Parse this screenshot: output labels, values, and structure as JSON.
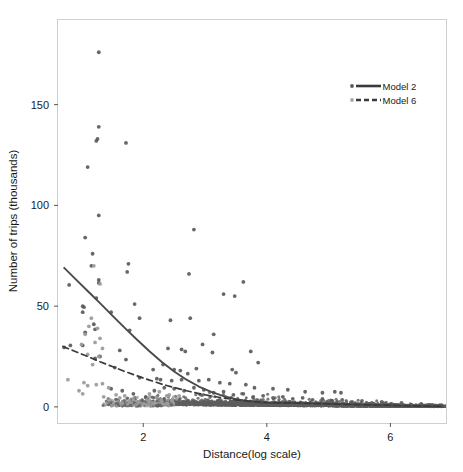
{
  "chart_data": {
    "type": "scatter",
    "title": "",
    "xlabel": "Distance(log scale)",
    "ylabel": "Number of trips (thousands)",
    "xlim": [
      0.62,
      6.9
    ],
    "ylim": [
      -8,
      192
    ],
    "xticks": [
      2,
      4,
      6
    ],
    "xtick_labels": [
      "2",
      "4",
      "6"
    ],
    "yticks": [
      0,
      50,
      100,
      150
    ],
    "ytick_labels": [
      "0",
      "50",
      "100",
      "150"
    ],
    "grid": false,
    "legend_position": "top-right",
    "panel_border": true,
    "series": [
      {
        "name": "Model 2",
        "marker": "circle",
        "color": "#5a5a5a",
        "line_style": "solid",
        "line_color": "#4a4a4a",
        "fit_curve": [
          [
            0.72,
            69.0
          ],
          [
            0.9,
            63.5
          ],
          [
            1.1,
            57.5
          ],
          [
            1.3,
            51.5
          ],
          [
            1.5,
            45.3
          ],
          [
            1.7,
            39.2
          ],
          [
            1.9,
            33.3
          ],
          [
            2.1,
            27.6
          ],
          [
            2.3,
            22.3
          ],
          [
            2.5,
            17.6
          ],
          [
            2.7,
            13.5
          ],
          [
            2.9,
            10.1
          ],
          [
            3.1,
            7.4
          ],
          [
            3.3,
            5.3
          ],
          [
            3.5,
            3.8
          ],
          [
            3.7,
            2.8
          ],
          [
            3.9,
            2.2
          ],
          [
            4.1,
            1.9
          ],
          [
            4.3,
            1.9
          ],
          [
            4.5,
            1.9
          ],
          [
            4.8,
            1.7
          ],
          [
            5.1,
            1.4
          ],
          [
            5.4,
            1.1
          ],
          [
            5.8,
            0.8
          ],
          [
            6.2,
            0.5
          ],
          [
            6.6,
            0.3
          ],
          [
            6.85,
            0.2
          ]
        ],
        "points": [
          [
            1.28,
            176.0
          ],
          [
            1.28,
            139.0
          ],
          [
            1.24,
            132.0
          ],
          [
            1.26,
            133.0
          ],
          [
            1.72,
            131.0
          ],
          [
            1.1,
            119.0
          ],
          [
            1.28,
            95.0
          ],
          [
            1.06,
            84.0
          ],
          [
            1.18,
            76.0
          ],
          [
            2.82,
            88.0
          ],
          [
            1.76,
            71.0
          ],
          [
            1.16,
            70.0
          ],
          [
            1.74,
            67.0
          ],
          [
            2.74,
            66.0
          ],
          [
            1.28,
            63.0
          ],
          [
            1.28,
            61.5
          ],
          [
            0.8,
            60.5
          ],
          [
            3.62,
            62.0
          ],
          [
            3.3,
            56.0
          ],
          [
            3.48,
            55.0
          ],
          [
            1.24,
            54.0
          ],
          [
            1.86,
            51.0
          ],
          [
            1.02,
            50.0
          ],
          [
            1.04,
            49.5
          ],
          [
            1.48,
            47.0
          ],
          [
            1.02,
            47.0
          ],
          [
            1.94,
            44.0
          ],
          [
            2.76,
            44.0
          ],
          [
            2.44,
            43.0
          ],
          [
            1.2,
            41.0
          ],
          [
            1.78,
            38.0
          ],
          [
            1.22,
            38.5
          ],
          [
            1.06,
            37.0
          ],
          [
            3.14,
            36.0
          ],
          [
            2.96,
            31.0
          ],
          [
            2.4,
            29.0
          ],
          [
            1.62,
            28.0
          ],
          [
            0.72,
            29.5
          ],
          [
            0.82,
            30.5
          ],
          [
            1.02,
            30.5
          ],
          [
            2.62,
            28.5
          ],
          [
            2.68,
            27.5
          ],
          [
            3.74,
            27.5
          ],
          [
            3.12,
            27.0
          ],
          [
            3.86,
            22.0
          ],
          [
            1.72,
            23.5
          ],
          [
            1.3,
            25.0
          ],
          [
            1.22,
            24.0
          ],
          [
            2.32,
            21.0
          ],
          [
            2.16,
            18.5
          ],
          [
            2.6,
            18.0
          ],
          [
            2.5,
            18.5
          ],
          [
            2.86,
            19.0
          ],
          [
            3.44,
            18.5
          ],
          [
            3.5,
            17.0
          ],
          [
            2.72,
            16.5
          ],
          [
            1.54,
            19.5
          ],
          [
            1.94,
            14.5
          ],
          [
            2.22,
            14.0
          ],
          [
            2.28,
            13.5
          ],
          [
            2.46,
            13.0
          ],
          [
            2.62,
            13.5
          ],
          [
            2.9,
            13.0
          ],
          [
            3.06,
            13.5
          ],
          [
            3.24,
            12.0
          ],
          [
            3.4,
            11.5
          ],
          [
            3.66,
            11.0
          ],
          [
            3.8,
            9.5
          ],
          [
            4.1,
            9.0
          ],
          [
            4.34,
            8.5
          ],
          [
            4.62,
            7.5
          ],
          [
            4.9,
            7.0
          ],
          [
            5.1,
            7.5
          ],
          [
            5.2,
            7.0
          ],
          [
            1.48,
            9.0
          ],
          [
            1.66,
            8.0
          ],
          [
            1.84,
            6.5
          ],
          [
            2.04,
            5.0
          ],
          [
            2.18,
            8.0
          ],
          [
            2.34,
            9.5
          ],
          [
            2.5,
            9.0
          ],
          [
            2.66,
            8.0
          ],
          [
            2.82,
            9.5
          ],
          [
            2.98,
            8.5
          ],
          [
            3.14,
            7.0
          ],
          [
            3.3,
            7.5
          ],
          [
            3.46,
            6.0
          ],
          [
            3.62,
            6.5
          ],
          [
            3.78,
            5.0
          ],
          [
            3.94,
            5.5
          ],
          [
            4.1,
            4.5
          ],
          [
            4.26,
            5.0
          ],
          [
            4.42,
            4.0
          ],
          [
            4.58,
            4.5
          ],
          [
            4.74,
            3.5
          ],
          [
            4.9,
            4.0
          ],
          [
            5.06,
            3.0
          ],
          [
            5.22,
            3.5
          ],
          [
            5.38,
            2.5
          ],
          [
            5.54,
            3.0
          ],
          [
            5.7,
            2.0
          ],
          [
            5.86,
            2.5
          ],
          [
            6.02,
            1.5
          ],
          [
            6.18,
            2.0
          ],
          [
            6.34,
            1.0
          ],
          [
            6.5,
            1.5
          ],
          [
            6.66,
            1.0
          ],
          [
            6.8,
            0.8
          ]
        ]
      },
      {
        "name": "Model 6",
        "marker": "circle",
        "color": "#9a9a9a",
        "line_style": "dashed",
        "line_color": "#3a3a3a",
        "fit_curve": [
          [
            0.7,
            30.0
          ],
          [
            0.9,
            27.5
          ],
          [
            1.1,
            25.0
          ],
          [
            1.3,
            22.4
          ],
          [
            1.5,
            20.0
          ],
          [
            1.7,
            17.6
          ],
          [
            1.9,
            15.4
          ],
          [
            2.1,
            13.3
          ],
          [
            2.3,
            11.3
          ],
          [
            2.5,
            9.6
          ],
          [
            2.7,
            8.0
          ],
          [
            2.9,
            6.6
          ],
          [
            3.1,
            5.4
          ],
          [
            3.3,
            4.4
          ],
          [
            3.5,
            3.5
          ],
          [
            3.7,
            2.9
          ],
          [
            3.9,
            2.4
          ],
          [
            4.1,
            2.1
          ],
          [
            4.3,
            2.0
          ],
          [
            4.6,
            1.8
          ],
          [
            5.0,
            1.5
          ],
          [
            5.4,
            1.2
          ],
          [
            5.9,
            0.9
          ],
          [
            6.4,
            0.5
          ],
          [
            6.85,
            0.3
          ]
        ],
        "points": [
          [
            1.2,
            70.0
          ],
          [
            1.3,
            61.0
          ],
          [
            1.16,
            44.0
          ],
          [
            1.12,
            40.0
          ],
          [
            1.26,
            39.0
          ],
          [
            1.06,
            36.0
          ],
          [
            1.3,
            34.0
          ],
          [
            1.22,
            32.0
          ],
          [
            1.0,
            31.0
          ],
          [
            1.34,
            29.0
          ],
          [
            1.1,
            26.0
          ],
          [
            1.28,
            25.0
          ],
          [
            1.18,
            21.0
          ],
          [
            0.78,
            13.5
          ],
          [
            1.04,
            12.0
          ],
          [
            1.1,
            10.5
          ],
          [
            1.24,
            11.0
          ],
          [
            1.34,
            11.5
          ],
          [
            0.96,
            8.0
          ],
          [
            1.02,
            6.5
          ],
          [
            1.44,
            9.5
          ],
          [
            1.56,
            6.0
          ],
          [
            1.62,
            4.5
          ],
          [
            1.7,
            5.5
          ],
          [
            1.78,
            3.0
          ],
          [
            1.84,
            4.0
          ],
          [
            1.92,
            2.5
          ],
          [
            2.0,
            1.5
          ],
          [
            2.06,
            3.5
          ],
          [
            2.14,
            2.0
          ],
          [
            2.22,
            4.5
          ],
          [
            2.3,
            2.5
          ],
          [
            2.38,
            5.5
          ],
          [
            2.46,
            3.0
          ],
          [
            2.54,
            4.0
          ],
          [
            1.46,
            3.5
          ],
          [
            1.36,
            5.0
          ],
          [
            1.52,
            2.0
          ],
          [
            1.64,
            1.5
          ],
          [
            1.88,
            1.0
          ],
          [
            2.1,
            6.5
          ],
          [
            2.26,
            7.5
          ],
          [
            2.42,
            6.0
          ],
          [
            2.58,
            5.5
          ]
        ]
      }
    ],
    "dense_band": {
      "description": "very dense overplotted cluster of points near y=0 spanning the full x range",
      "x_start": 2.2,
      "x_end": 6.88,
      "y_center": 1.0,
      "y_spread": 4.5
    }
  },
  "legend": {
    "entries": [
      {
        "label": "Model 2",
        "line_style": "solid",
        "marker_color": "#5a5a5a",
        "line_color": "#3a3a3a"
      },
      {
        "label": "Model 6",
        "line_style": "dashed",
        "marker_color": "#a8a8a8",
        "line_color": "#3a3a3a"
      }
    ]
  },
  "colors": {
    "background": "#ffffff",
    "panel_border": "#cfcfcf",
    "text": "#1a1a1a",
    "model2_point": "#5a5a5a",
    "model6_point": "#9a9a9a",
    "curve": "#3f3f3f"
  }
}
